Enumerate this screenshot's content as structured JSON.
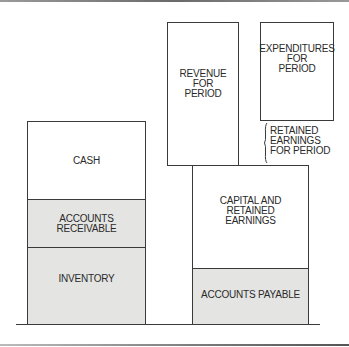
{
  "diagram": {
    "type": "balance-sheet-block-diagram",
    "assets": {
      "cash": "CASH",
      "accounts_receivable": "ACCOUNTS RECEIVABLE",
      "inventory": "INVENTORY"
    },
    "liabilities_equity": {
      "capital_and_retained_earnings": "CAPITAL AND\nRETAINED\nEARNINGS",
      "accounts_payable": "ACCOUNTS PAYABLE"
    },
    "period": {
      "revenue": "REVENUE\nFOR\nPERIOD",
      "expenditures": "EXPENDITURES\nFOR\nPERIOD",
      "retained_earnings_for_period": "RETAINED\nEARNINGS\nFOR PERIOD"
    },
    "colors": {
      "line": "#3a3a3a",
      "shaded_fill": "#e4e4e2",
      "background": "#ffffff"
    }
  }
}
